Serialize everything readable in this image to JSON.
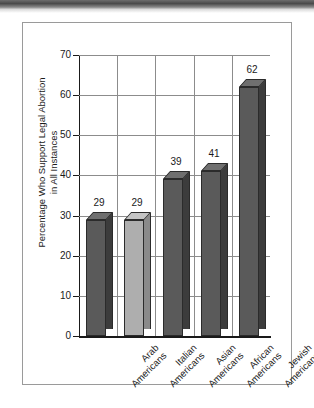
{
  "chart_data": {
    "type": "bar",
    "title": "",
    "xlabel": "",
    "ylabel": "Percentage Who Support Legal Abortion in All Instances",
    "ylabel_line1": "Percentage Who Support Legal Abortion",
    "ylabel_line2": "in All Instances",
    "categories": [
      "Arab Americans",
      "Italian Americans",
      "Asian Americans",
      "African Americans",
      "Jewish Americans"
    ],
    "category_lines": [
      [
        "Arab",
        "Americans"
      ],
      [
        "Italian",
        "Americans"
      ],
      [
        "Asian",
        "Americans"
      ],
      [
        "African",
        "Americans"
      ],
      [
        "Jewish",
        "Americans"
      ]
    ],
    "values": [
      29,
      29,
      39,
      41,
      62
    ],
    "value_labels": [
      "29",
      "29",
      "39",
      "41",
      "62"
    ],
    "ylim": [
      0,
      70
    ],
    "ytick_values": [
      0,
      10,
      20,
      30,
      40,
      50,
      60,
      70
    ],
    "ytick_labels": [
      "0",
      "10",
      "20",
      "30",
      "40",
      "50",
      "60",
      "70"
    ],
    "grid": true,
    "legend": "none",
    "bar_colors": [
      "#5a5a5a",
      "#aeaeae",
      "#5a5a5a",
      "#5a5a5a",
      "#5a5a5a"
    ],
    "style": "3d-column"
  },
  "colors": {
    "bar_dark": "#5a5a5a",
    "bar_light": "#aeaeae",
    "grid": "#8c8c8c",
    "axis": "#1a1a1a",
    "card_border": "#9a9a9a",
    "background": "#ffffff"
  }
}
